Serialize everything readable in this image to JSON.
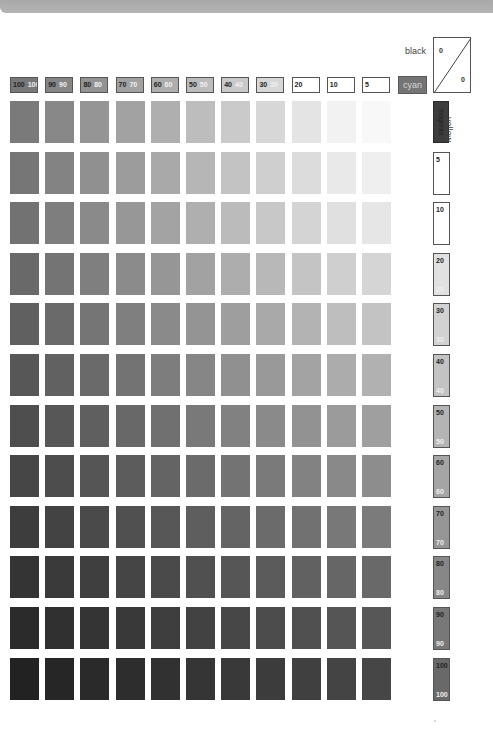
{
  "chart_data": {
    "type": "heatmap",
    "title": "",
    "column_axis_label": "cyan",
    "row_axis_label": "yellow",
    "corner_axis_label": "black",
    "corner_values": [
      "0",
      "0"
    ],
    "magenta_label": "magenta",
    "columns": [
      {
        "dark": "100",
        "light": "100",
        "value": 100
      },
      {
        "dark": "90",
        "light": "90",
        "value": 90
      },
      {
        "dark": "80",
        "light": "80",
        "value": 80
      },
      {
        "dark": "70",
        "light": "70",
        "value": 70
      },
      {
        "dark": "60",
        "light": "60",
        "value": 60
      },
      {
        "dark": "50",
        "light": "50",
        "value": 50
      },
      {
        "dark": "40",
        "light": "40",
        "value": 40
      },
      {
        "dark": "30",
        "light": "30",
        "value": 30
      },
      {
        "dark": "20",
        "light": "",
        "value": 20
      },
      {
        "dark": "10",
        "light": "",
        "value": 10
      },
      {
        "dark": "5",
        "light": "",
        "value": 5
      }
    ],
    "rows": [
      {
        "top": "",
        "bottom": "",
        "value": 0,
        "label_type": "magenta"
      },
      {
        "top": "5",
        "bottom": "",
        "value": 5
      },
      {
        "top": "10",
        "bottom": "",
        "value": 10
      },
      {
        "top": "20",
        "bottom": "20",
        "value": 20
      },
      {
        "top": "30",
        "bottom": "30",
        "value": 30
      },
      {
        "top": "40",
        "bottom": "40",
        "value": 40
      },
      {
        "top": "50",
        "bottom": "50",
        "value": 50
      },
      {
        "top": "60",
        "bottom": "60",
        "value": 60
      },
      {
        "top": "70",
        "bottom": "70",
        "value": 70
      },
      {
        "top": "80",
        "bottom": "80",
        "value": 80
      },
      {
        "top": "90",
        "bottom": "90",
        "value": 90
      },
      {
        "top": "100",
        "bottom": "100",
        "value": 100
      }
    ],
    "extra_column_label": "0",
    "grid": false,
    "legend": "none"
  }
}
